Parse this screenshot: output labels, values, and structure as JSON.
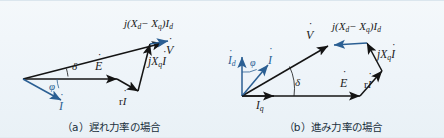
{
  "figure": {
    "background_color": "#eef4f9",
    "vector_color_black": "#141414",
    "vector_color_blue": "#2b5f93"
  },
  "panels": [
    {
      "id": "a",
      "caption": "（a）遅れ力率の場合",
      "caption_prefix": "(a)",
      "caption_text": "遅れ力率の場合",
      "labels": {
        "v": "V",
        "e": "E",
        "i": "I",
        "ri": "rI",
        "jxqi": "jX",
        "jxqi_sub": "q",
        "jxqi_tail": "I",
        "jxdxq_lead": "j(X",
        "jxdxq_sub1": "d",
        "jxdxq_mid": "− X",
        "jxdxq_sub2": "q",
        "jxdxq_close": ")I",
        "jxdxq_sub3": "d",
        "delta": "δ",
        "phi": "φ"
      }
    },
    {
      "id": "b",
      "caption": "（b）進み力率の場合",
      "caption_prefix": "(b)",
      "caption_text": "進み力率の場合",
      "labels": {
        "v": "V",
        "e": "E",
        "i": "I",
        "id": "I",
        "id_sub": "d",
        "iq": "I",
        "iq_sub": "q",
        "ri": "rI",
        "jxqi": "jX",
        "jxqi_sub": "q",
        "jxqi_tail": "I",
        "jxdxq_lead": "j(X",
        "jxdxq_sub1": "d",
        "jxdxq_mid": "− X",
        "jxdxq_sub2": "q",
        "jxdxq_close": ")I",
        "jxdxq_sub3": "d",
        "delta": "δ",
        "phi": "φ"
      }
    }
  ]
}
